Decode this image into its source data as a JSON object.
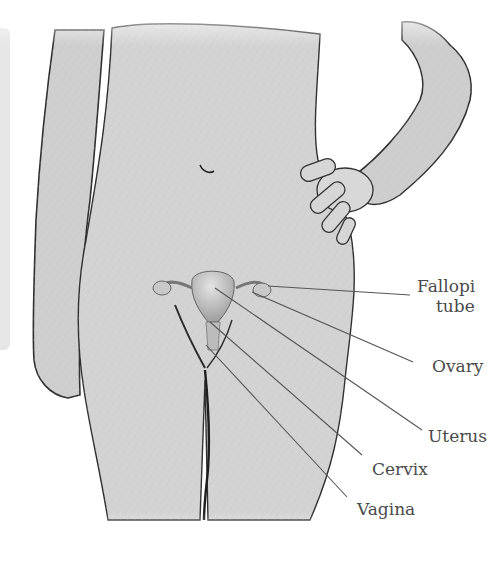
{
  "diagram": {
    "colors": {
      "skin": "#d2d2d2",
      "skin_dark": "#bdbdbd",
      "outline": "#3a3a3a",
      "organ": "#b8b8b8",
      "leader_line": "#555555",
      "label_text": "#4a4a4a",
      "side_panel": "#e6e6e6"
    },
    "labels": [
      {
        "id": "fallopian-tube",
        "line1": "Fallopi",
        "line2": "tube"
      },
      {
        "id": "ovary",
        "line1": "Ovary"
      },
      {
        "id": "uterus",
        "line1": "Uterus"
      },
      {
        "id": "cervix",
        "line1": "Cervix"
      },
      {
        "id": "vagina",
        "line1": "Vagina"
      }
    ]
  }
}
